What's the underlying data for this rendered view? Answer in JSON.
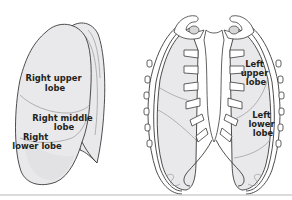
{
  "figure": {
    "left_panel": {
      "title": "Right lung lateral view",
      "labels": {
        "upper_line1": "Right upper",
        "upper_line2": "lobe",
        "middle_line1": "Right middle",
        "middle_line2": "lobe",
        "lower_line1": "Right",
        "lower_line2": "lower lobe"
      }
    },
    "right_panel": {
      "title": "Chest anterior view",
      "labels": {
        "upper_line1": "Left",
        "upper_line2": "upper",
        "upper_line3": "lobe",
        "lower_line1": "Left",
        "lower_line2": "lower",
        "lower_line3": "lobe"
      }
    },
    "colors": {
      "lung_fill": "#e9e9eb",
      "outline": "#3a3a3a",
      "label_text": "#231f20",
      "divider": "#b8b8b8"
    }
  }
}
